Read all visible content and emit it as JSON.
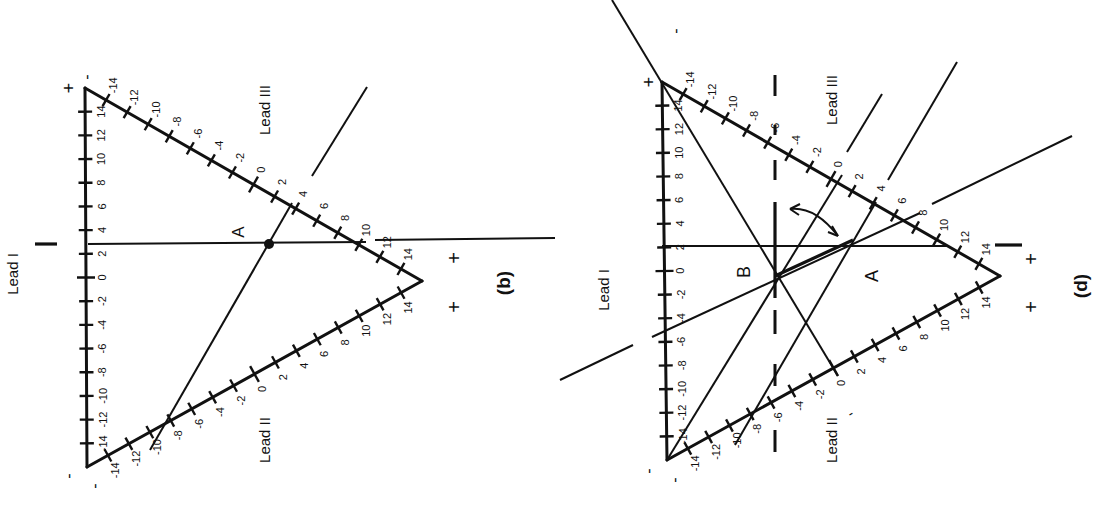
{
  "figure": {
    "orientation": "rotated 90 degrees counter-clockwise",
    "ink_color": "#111111",
    "background_color": "#ffffff"
  },
  "panels": [
    {
      "id": "b",
      "caption": "(b)",
      "vertices": {
        "top": [
          85,
          88
        ],
        "bottom": [
          87,
          467
        ],
        "right": [
          422,
          281
        ]
      },
      "leads": [
        {
          "name": "Lead I",
          "label": "Lead I",
          "from": "bottom",
          "to": "top",
          "neg_sign": "-",
          "pos_sign": "+"
        },
        {
          "name": "Lead III",
          "label": "Lead III",
          "from": "top",
          "to": "right",
          "neg_sign": "-",
          "pos_sign": "+"
        },
        {
          "name": "Lead II",
          "label": "Lead II",
          "from": "bottom",
          "to": "right",
          "neg_sign": "-",
          "pos_sign": "+"
        }
      ],
      "tick_labels": [
        "-14",
        "-12",
        "-10",
        "-8",
        "-6",
        "-4",
        "-2",
        "0",
        "2",
        "4",
        "6",
        "8",
        "10",
        "12",
        "14"
      ],
      "point_labels": [
        {
          "label": "A",
          "x": 269,
          "y": 244
        }
      ],
      "readings": {
        "lead_I": 3,
        "lead_III": 4,
        "lead_II": -10
      },
      "signs": {
        "top_plus": "+",
        "top_minus": "-",
        "bottom_minus_1": "-",
        "bottom_minus_2": "-",
        "right_plus_1": "+",
        "right_plus_2": "+"
      }
    },
    {
      "id": "d",
      "caption": "(d)",
      "vertices": {
        "top": [
          662,
          82
        ],
        "bottom": [
          667,
          460
        ],
        "right": [
          1000,
          276
        ]
      },
      "leads": [
        {
          "name": "Lead I",
          "label": "Lead I",
          "from": "bottom",
          "to": "top",
          "neg_sign": "-",
          "pos_sign": "+"
        },
        {
          "name": "Lead III",
          "label": "Lead III",
          "from": "top",
          "to": "right",
          "neg_sign": "-",
          "pos_sign": "+"
        },
        {
          "name": "Lead II",
          "label": "Lead II",
          "from": "bottom",
          "to": "right",
          "neg_sign": "-",
          "pos_sign": "+"
        }
      ],
      "tick_labels": [
        "-14",
        "-12",
        "-10",
        "-8",
        "-6",
        "-4",
        "-2",
        "0",
        "2",
        "4",
        "6",
        "8",
        "10",
        "12",
        "14"
      ],
      "point_labels": [
        {
          "label": "A",
          "x": 853,
          "y": 240
        },
        {
          "label": "B",
          "x": 775,
          "y": 276
        }
      ],
      "readings": {
        "lead_I": 3,
        "lead_III": 4,
        "lead_II": -10
      },
      "annotations": [
        "curved arrow showing rotation of axis from A toward vertical through B",
        "dashed vertical reference line through B"
      ],
      "signs": {
        "top_plus": "+",
        "top_minus": "-",
        "far_minus": "-",
        "bottom_minus_1": "-",
        "bottom_minus_2": "-",
        "right_plus_1": "+",
        "right_plus_2": "+"
      }
    }
  ],
  "labels": {
    "lead_I": "Lead I",
    "lead_II": "Lead II",
    "lead_III": "Lead III",
    "point_A": "A",
    "point_B": "B",
    "caption_b": "(b)",
    "caption_d": "(d)",
    "plus": "+",
    "minus": "-"
  }
}
